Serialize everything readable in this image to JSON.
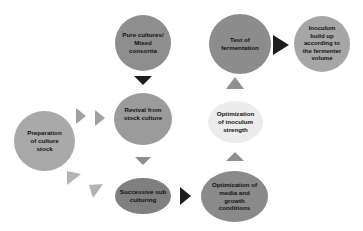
{
  "diagram": {
    "nodes": [
      {
        "id": "preparation",
        "label": "Preparation\nof culture\nstock",
        "color": "#a9a9a9"
      },
      {
        "id": "pure-cultures",
        "label": "Pure cultures/\nMixed\nconsortia",
        "color": "#8e8e8e"
      },
      {
        "id": "revival",
        "label": "Revival from\nstock culture",
        "color": "#9b9b9b"
      },
      {
        "id": "successive",
        "label": "Successive sub\nculturing",
        "color": "#7f7f7f"
      },
      {
        "id": "optimization-media",
        "label": "Optimization of\nmedia and\ngrowth\nconditions",
        "color": "#8a8a8a"
      },
      {
        "id": "optimization-inoculum",
        "label": "Optimization\nof inoculum\nstrength",
        "color": "#ececec"
      },
      {
        "id": "test-fermentation",
        "label": "Test of\nfermentation",
        "color": "#8c8c8c"
      },
      {
        "id": "inoculum-buildup",
        "label": "Inoculum\nbuild up\naccording to\nthe fermenter\nvolume",
        "color": "#a6a6a6"
      }
    ],
    "edges": [
      {
        "from": "preparation",
        "to": "revival"
      },
      {
        "from": "preparation",
        "to": "successive"
      },
      {
        "from": "pure-cultures",
        "to": "revival"
      },
      {
        "from": "revival",
        "to": "successive"
      },
      {
        "from": "successive",
        "to": "optimization-media"
      },
      {
        "from": "optimization-media",
        "to": "optimization-inoculum"
      },
      {
        "from": "optimization-inoculum",
        "to": "test-fermentation"
      },
      {
        "from": "test-fermentation",
        "to": "inoculum-buildup"
      }
    ],
    "colors": {
      "arrow_dark": "#1e1e1e",
      "arrow_gray": "#8f8f8f",
      "arrow_light": "#b3b3b3"
    }
  }
}
